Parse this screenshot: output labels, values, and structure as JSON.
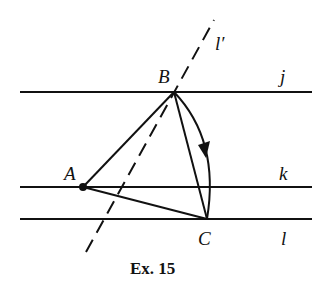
{
  "diagram": {
    "caption": "Ex. 15",
    "lines": [
      {
        "name": "j",
        "label": "j",
        "y": 92
      },
      {
        "name": "k",
        "label": "k",
        "y": 187
      },
      {
        "name": "l",
        "label": "l",
        "y": 219
      }
    ],
    "dashed_line": {
      "label": "l′"
    },
    "points": [
      {
        "name": "A",
        "label": "A",
        "x": 83,
        "y": 187
      },
      {
        "name": "B",
        "label": "B",
        "x": 174,
        "y": 92
      },
      {
        "name": "C",
        "label": "C",
        "x": 207,
        "y": 219
      }
    ],
    "colors": {
      "stroke": "#111111",
      "background": "#ffffff"
    }
  }
}
